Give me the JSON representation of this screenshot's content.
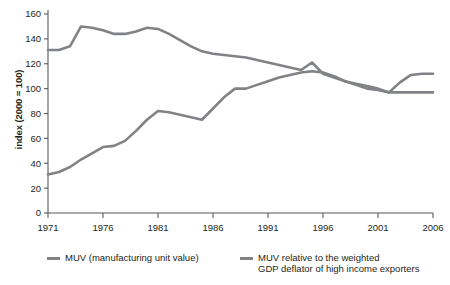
{
  "chart_data": {
    "type": "line",
    "title": "",
    "xlabel": "",
    "ylabel": "index (2000 = 100)",
    "xlim": [
      1971,
      2006
    ],
    "ylim": [
      0,
      160
    ],
    "grid": false,
    "legend_position": "bottom",
    "xticks": [
      1971,
      1976,
      1981,
      1986,
      1991,
      1996,
      2001,
      2006
    ],
    "yticks": [
      0,
      20,
      40,
      60,
      80,
      100,
      120,
      140,
      160
    ],
    "x": [
      1971,
      1972,
      1973,
      1974,
      1975,
      1976,
      1977,
      1978,
      1979,
      1980,
      1981,
      1982,
      1983,
      1984,
      1985,
      1986,
      1987,
      1988,
      1989,
      1990,
      1991,
      1992,
      1993,
      1994,
      1995,
      1996,
      1997,
      1998,
      1999,
      2000,
      2001,
      2002,
      2003,
      2004,
      2005,
      2006
    ],
    "series": [
      {
        "name": "MUV (manufacturing unit value)",
        "color": "#808285",
        "values": [
          31,
          33,
          37,
          43,
          48,
          53,
          54,
          58,
          66,
          75,
          82,
          81,
          79,
          77,
          75,
          84,
          93,
          100,
          100,
          103,
          106,
          109,
          111,
          113,
          114,
          113,
          110,
          106,
          103,
          100,
          99,
          97,
          105,
          111,
          112,
          112
        ]
      },
      {
        "name": "MUV relative to the weighted\nGDP deflator of high income exporters",
        "color": "#808285",
        "values": [
          131,
          131,
          134,
          150,
          149,
          147,
          144,
          144,
          146,
          149,
          148,
          144,
          139,
          134,
          130,
          128,
          127,
          126,
          125,
          123,
          121,
          119,
          117,
          115,
          121,
          112,
          109,
          106,
          104,
          102,
          100,
          97,
          97,
          97,
          97,
          97
        ]
      }
    ]
  },
  "legend": {
    "items": [
      {
        "label": "MUV (manufacturing unit value)"
      },
      {
        "label": "MUV relative to the weighted\nGDP deflator of high income exporters"
      }
    ]
  },
  "axis": {
    "y_title": "index (2000 = 100)",
    "y_ticks": [
      "0",
      "20",
      "40",
      "60",
      "80",
      "100",
      "120",
      "140",
      "160"
    ],
    "x_ticks": [
      "1971",
      "1976",
      "1981",
      "1986",
      "1991",
      "1996",
      "2001",
      "2006"
    ]
  },
  "colors": {
    "line": "#808285",
    "axis": "#58595b",
    "text": "#231f20"
  }
}
